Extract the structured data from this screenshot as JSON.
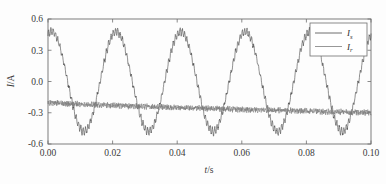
{
  "figure": {
    "background_color": "#fdfdfd",
    "frame_color": "#6f6f6f"
  },
  "chart_data": {
    "type": "line",
    "title": "",
    "xlabel": "t/s",
    "ylabel": "I/A",
    "xlim": [
      0.0,
      0.1
    ],
    "ylim": [
      -0.6,
      0.6
    ],
    "xticks": [
      0.0,
      0.02,
      0.04,
      0.06,
      0.08,
      0.1
    ],
    "xtick_labels": [
      "0.00",
      "0.02",
      "0.04",
      "0.06",
      "0.08",
      "0.10"
    ],
    "yticks": [
      -0.6,
      -0.3,
      0.0,
      0.3,
      0.6
    ],
    "ytick_labels": [
      "-0.6",
      "-0.3",
      "0.0",
      "0.3",
      "0.6"
    ],
    "grid": false,
    "legend_position": "upper right",
    "series": [
      {
        "name": "I_s",
        "label_base": "I",
        "label_sub": "s",
        "color": "#4a4a4a",
        "description": "Stator current: 50 Hz sinusoid with switching ripple",
        "waveform": "sine",
        "amplitude": 0.48,
        "frequency_hz": 50,
        "phase_deg": 70,
        "offset": 0.0,
        "ripple_amplitude": 0.035,
        "ripple_frequency_hz": 1400,
        "noise_amplitude": 0.012,
        "peaks": [
          0.485,
          0.49,
          0.48,
          0.49,
          0.47
        ],
        "peak_times": [
          0.001,
          0.021,
          0.041,
          0.061,
          0.081
        ],
        "troughs": [
          -0.48,
          -0.49,
          -0.485,
          -0.48,
          -0.485
        ],
        "trough_times": [
          0.011,
          0.031,
          0.051,
          0.071,
          0.091
        ]
      },
      {
        "name": "I_r",
        "label_base": "I",
        "label_sub": "r",
        "color": "#7d7d7d",
        "description": "Rotor current: noisy near-DC trace drifting from -0.20 A to -0.30 A",
        "waveform": "noise",
        "start_value": -0.2,
        "end_value": -0.3,
        "noise_amplitude": 0.022,
        "noise_frequency_hz": 1800,
        "mean_left": -0.2,
        "mean_right": -0.3
      }
    ]
  },
  "legend": {
    "entries": [
      {
        "label_base": "I",
        "label_sub": "s",
        "color": "#4a4a4a"
      },
      {
        "label_base": "I",
        "label_sub": "r",
        "color": "#7d7d7d"
      }
    ]
  }
}
